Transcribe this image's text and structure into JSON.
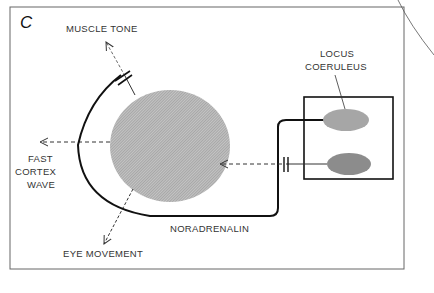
{
  "panel_label": "C",
  "labels": {
    "muscle_tone": "MUSCLE TONE",
    "locus_line1": "LOCUS",
    "locus_line2": "COERULEUS",
    "fast": "FAST",
    "cortex": "CORTEX",
    "wave": "WAVE",
    "noradrenalin": "NORADRENALIN",
    "eye_movement": "EYE MOVEMENT"
  },
  "colors": {
    "hatched_circle": "#9a9a9a",
    "ellipse_top": "#a8a8a8",
    "ellipse_bottom": "#8a8a8a",
    "line": "#111111",
    "frame": "#555555"
  }
}
